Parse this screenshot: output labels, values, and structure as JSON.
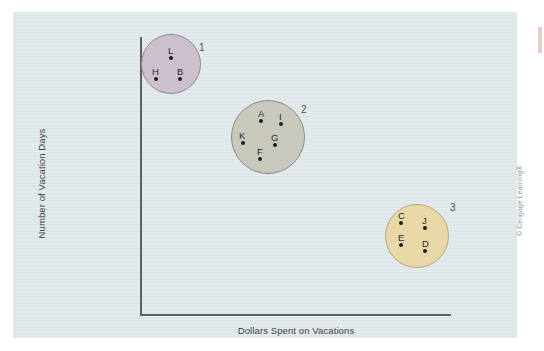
{
  "figure": {
    "credit": "© Cengage Learning®",
    "background_color": "#dde5e8",
    "axis_color": "#5c6063"
  },
  "chart_data": {
    "type": "scatter",
    "title": "",
    "subtitle": "",
    "xlabel": "Dollars Spent on Vacations",
    "ylabel": "Number of Vacation Days",
    "grid": false,
    "legend": "none",
    "axis_ticks": {
      "x": [],
      "y": []
    },
    "axis_ranges": {
      "x": [
        0,
        100
      ],
      "y": [
        0,
        100
      ]
    },
    "annotation_note": "Cluster analysis diagram: three labeled clusters of lettered cases",
    "clusters": [
      {
        "id": "1",
        "number_label": "1",
        "fill_color": "#ccc0cc",
        "stroke_color": "#8c8c90",
        "center_px": [
          158,
          52
        ],
        "radius_px": 30,
        "members": [
          "L",
          "H",
          "B"
        ],
        "points": [
          {
            "label": "L",
            "x_px": 158,
            "y_px": 46,
            "label_dx": -3,
            "label_dy": -13
          },
          {
            "label": "H",
            "x_px": 143,
            "y_px": 67,
            "label_dx": -4,
            "label_dy": -13
          },
          {
            "label": "B",
            "x_px": 167,
            "y_px": 67,
            "label_dx": -3,
            "label_dy": -13
          }
        ]
      },
      {
        "id": "2",
        "number_label": "2",
        "fill_color": "#c9c8bd",
        "stroke_color": "#8c8c90",
        "center_px": [
          255,
          125
        ],
        "radius_px": 37,
        "members": [
          "A",
          "I",
          "K",
          "G",
          "F"
        ],
        "points": [
          {
            "label": "A",
            "x_px": 248,
            "y_px": 109,
            "label_dx": -3,
            "label_dy": -13
          },
          {
            "label": "I",
            "x_px": 268,
            "y_px": 112,
            "label_dx": -2,
            "label_dy": -13
          },
          {
            "label": "K",
            "x_px": 230,
            "y_px": 131,
            "label_dx": -4,
            "label_dy": -13
          },
          {
            "label": "G",
            "x_px": 262,
            "y_px": 133,
            "label_dx": -4,
            "label_dy": -13
          },
          {
            "label": "F",
            "x_px": 247,
            "y_px": 147,
            "label_dx": -3,
            "label_dy": -13
          }
        ]
      },
      {
        "id": "3",
        "number_label": "3",
        "fill_color": "#e8d8a8",
        "stroke_color": "#b9a878",
        "center_px": [
          404,
          224
        ],
        "radius_px": 32,
        "members": [
          "C",
          "J",
          "E",
          "D"
        ],
        "points": [
          {
            "label": "C",
            "x_px": 388,
            "y_px": 211,
            "label_dx": -3,
            "label_dy": -13
          },
          {
            "label": "J",
            "x_px": 412,
            "y_px": 216,
            "label_dx": -3,
            "label_dy": -13
          },
          {
            "label": "E",
            "x_px": 388,
            "y_px": 233,
            "label_dx": -3,
            "label_dy": -13
          },
          {
            "label": "D",
            "x_px": 412,
            "y_px": 239,
            "label_dx": -3,
            "label_dy": -13
          }
        ]
      }
    ],
    "cluster_number_positions": [
      {
        "id": "1",
        "x_px": 186,
        "y_px": 30
      },
      {
        "id": "2",
        "x_px": 288,
        "y_px": 92
      },
      {
        "id": "3",
        "x_px": 437,
        "y_px": 190
      }
    ]
  }
}
